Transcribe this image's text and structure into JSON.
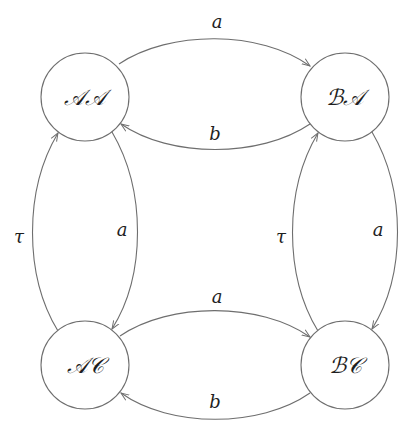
{
  "diagram": {
    "type": "state-transition-graph",
    "nodes": [
      {
        "id": "AA",
        "label": "𝒜𝒜",
        "cx": 85,
        "cy": 97
      },
      {
        "id": "BA",
        "label": "ℬ𝒜",
        "cx": 345,
        "cy": 97
      },
      {
        "id": "AC",
        "label": "𝒜𝒞",
        "cx": 85,
        "cy": 365
      },
      {
        "id": "BC",
        "label": "ℬ𝒞",
        "cx": 345,
        "cy": 365
      }
    ],
    "edges": [
      {
        "from": "AA",
        "to": "BA",
        "label": "a"
      },
      {
        "from": "BA",
        "to": "AA",
        "label": "b"
      },
      {
        "from": "AC",
        "to": "AA",
        "label": "τ"
      },
      {
        "from": "AA",
        "to": "AC",
        "label": "a"
      },
      {
        "from": "BC",
        "to": "BA",
        "label": "τ"
      },
      {
        "from": "BA",
        "to": "BC",
        "label": "a"
      },
      {
        "from": "AC",
        "to": "BC",
        "label": "a"
      },
      {
        "from": "BC",
        "to": "AC",
        "label": "b"
      }
    ],
    "colors": {
      "stroke": "#6e6e6e",
      "text": "#1e1e1e",
      "background": "#ffffff"
    }
  }
}
